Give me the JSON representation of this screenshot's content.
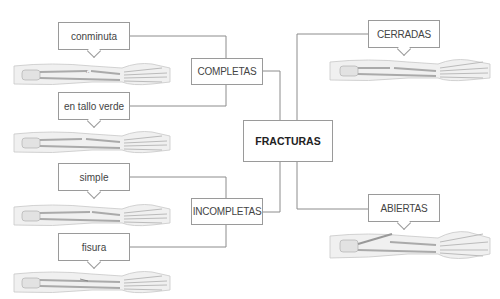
{
  "title": "FRACTURAS",
  "categories": {
    "completas": {
      "label": "COMPLETAS",
      "types": [
        {
          "label": "conminuta"
        },
        {
          "label": "en tallo verde"
        }
      ]
    },
    "incompletas": {
      "label": "INCOMPLETAS",
      "types": [
        {
          "label": "simple"
        },
        {
          "label": "fisura"
        }
      ]
    },
    "cerradas": {
      "label": "CERRADAS"
    },
    "abiertas": {
      "label": "ABIERTAS"
    }
  },
  "colors": {
    "line": "#8c8c8c",
    "box_border": "#9a9a9a",
    "bone": "#d9d9d9",
    "skin": "#eeeeee"
  }
}
